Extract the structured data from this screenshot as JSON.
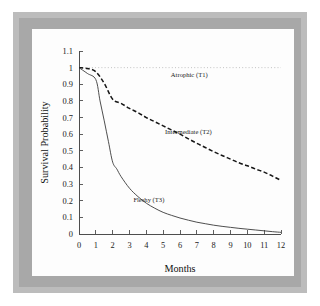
{
  "figure": {
    "frame_color": "#bcbcbc",
    "background_color": "#ffffff",
    "plot_background": "#fdfdfd"
  },
  "chart_data": {
    "type": "line",
    "title": "",
    "xlabel": "Months",
    "ylabel": "Survival Probability",
    "xlim": [
      0,
      12
    ],
    "ylim": [
      0,
      1.1
    ],
    "grid": false,
    "legend_position": "inline-annotations",
    "x_ticks": [
      "0",
      "1",
      "2",
      "3",
      "4",
      "5",
      "6",
      "7",
      "8",
      "9",
      "10",
      "11",
      "12"
    ],
    "y_ticks": [
      "0",
      "0.1",
      "0.2",
      "0.3",
      "0.4",
      "0.5",
      "0.6",
      "0.7",
      "0.8",
      "0.9",
      "1",
      "1.1"
    ],
    "series": [
      {
        "name": "Atrophic (T1)",
        "style": "dotted",
        "color": "#b4b4b4",
        "width": 0.8,
        "label_x": 6.55,
        "label_y": 0.945,
        "x": [
          0,
          1,
          2,
          3,
          4,
          5,
          6,
          7,
          8,
          9,
          10,
          11,
          12
        ],
        "values": [
          1.0,
          1.0,
          1.0,
          1.0,
          1.0,
          1.0,
          1.0,
          1.0,
          1.0,
          1.0,
          1.0,
          1.0,
          1.0
        ]
      },
      {
        "name": "Intermediate (T2)",
        "style": "dashed",
        "color": "#161616",
        "width": 1.5,
        "label_x": 6.5,
        "label_y": 0.6,
        "x": [
          0,
          0.5,
          1,
          1.5,
          2,
          2.5,
          3,
          3.5,
          4,
          4.5,
          5,
          5.5,
          6,
          6.5,
          7,
          7.5,
          8,
          8.5,
          9,
          9.5,
          10,
          10.5,
          11,
          11.5,
          12
        ],
        "values": [
          1.0,
          0.995,
          0.975,
          0.905,
          0.81,
          0.785,
          0.755,
          0.73,
          0.7,
          0.675,
          0.65,
          0.625,
          0.6,
          0.572,
          0.545,
          0.52,
          0.495,
          0.472,
          0.45,
          0.428,
          0.41,
          0.39,
          0.372,
          0.348,
          0.322
        ]
      },
      {
        "name": "Fleshy (T3)",
        "style": "solid",
        "color": "#3a3a3a",
        "width": 0.9,
        "label_x": 4.15,
        "label_y": 0.195,
        "x": [
          0,
          0.5,
          1,
          1.25,
          1.5,
          1.75,
          2,
          2.25,
          2.5,
          3,
          3.5,
          4,
          4.5,
          5,
          5.5,
          6,
          6.5,
          7,
          7.5,
          8,
          8.5,
          9,
          9.5,
          10,
          10.5,
          11,
          11.5,
          12
        ],
        "values": [
          1.0,
          0.965,
          0.928,
          0.8,
          0.68,
          0.555,
          0.432,
          0.39,
          0.345,
          0.275,
          0.225,
          0.185,
          0.155,
          0.13,
          0.112,
          0.096,
          0.083,
          0.071,
          0.062,
          0.053,
          0.046,
          0.04,
          0.034,
          0.029,
          0.024,
          0.019,
          0.014,
          0.01
        ]
      }
    ]
  }
}
